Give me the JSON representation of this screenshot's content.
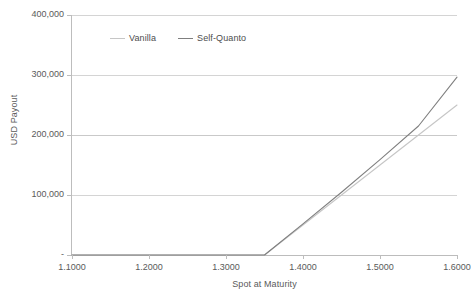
{
  "chart_data": {
    "type": "line",
    "title": "",
    "xlabel": "Spot at Maturity",
    "ylabel": "USD Payout",
    "xlim": [
      1.1,
      1.6
    ],
    "ylim": [
      0,
      400000
    ],
    "grid": true,
    "legend_position": "top-left-inside",
    "x_tick_labels": [
      "1.1000",
      "1.2000",
      "1.3000",
      "1.4000",
      "1.5000",
      "1.6000"
    ],
    "x_tick_values": [
      1.1,
      1.2,
      1.3,
      1.4,
      1.5,
      1.6
    ],
    "y_tick_labels": [
      "-",
      "100,000",
      "200,000",
      "300,000",
      "400,000"
    ],
    "y_tick_values": [
      0,
      100000,
      200000,
      300000,
      400000
    ],
    "strike": 1.35,
    "series": [
      {
        "name": "Vanilla",
        "color": "#c6c6c6",
        "x": [
          1.1,
          1.2,
          1.3,
          1.35,
          1.4,
          1.45,
          1.5,
          1.55,
          1.6
        ],
        "values": [
          0,
          0,
          0,
          0,
          50000,
          100000,
          150000,
          200000,
          250000
        ]
      },
      {
        "name": "Self-Quanto",
        "color": "#7f7f7f",
        "x": [
          1.1,
          1.2,
          1.3,
          1.35,
          1.4,
          1.45,
          1.5,
          1.55,
          1.6
        ],
        "values": [
          0,
          0,
          0,
          0,
          51800,
          104600,
          158900,
          215000,
          296500
        ]
      }
    ]
  },
  "axes": {
    "y_title": "USD Payout",
    "x_title": "Spot at Maturity",
    "y_labels": [
      {
        "text": "400,000",
        "value": 400000
      },
      {
        "text": "300,000",
        "value": 300000
      },
      {
        "text": "200,000",
        "value": 200000
      },
      {
        "text": "100,000",
        "value": 100000
      },
      {
        "text": "-",
        "value": 0
      }
    ],
    "x_labels": [
      {
        "text": "1.1000",
        "value": 1.1
      },
      {
        "text": "1.2000",
        "value": 1.2
      },
      {
        "text": "1.3000",
        "value": 1.3
      },
      {
        "text": "1.4000",
        "value": 1.4
      },
      {
        "text": "1.5000",
        "value": 1.5
      },
      {
        "text": "1.6000",
        "value": 1.6
      }
    ]
  },
  "legend": {
    "entries": [
      {
        "label": "Vanilla",
        "color": "#c6c6c6"
      },
      {
        "label": "Self-Quanto",
        "color": "#7f7f7f"
      }
    ]
  },
  "colors": {
    "background": "#ffffff",
    "gridline": "#d4d4d4",
    "axis": "#bdbdbd",
    "text": "#5a5a5a",
    "vanilla": "#c6c6c6",
    "self_quanto": "#7f7f7f"
  }
}
